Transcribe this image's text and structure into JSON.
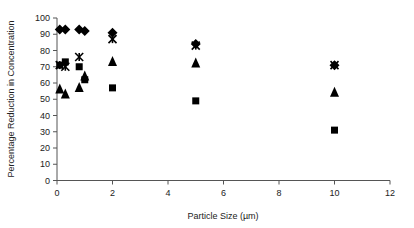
{
  "chart_data": {
    "type": "scatter",
    "title": "",
    "xlabel": "Particle Size (µm)",
    "ylabel": "Percentage Reduction in Concentration",
    "xlim": [
      0,
      12
    ],
    "ylim": [
      0,
      100
    ],
    "xticks": [
      0,
      2,
      4,
      6,
      8,
      10,
      12
    ],
    "yticks": [
      0,
      10,
      20,
      30,
      40,
      50,
      60,
      70,
      80,
      90,
      100
    ],
    "grid": false,
    "legend": "none",
    "series": [
      {
        "name": "diamond",
        "marker": "diamond",
        "x": [
          0.1,
          0.3,
          0.8,
          1.0,
          2,
          5,
          10
        ],
        "y": [
          93,
          93,
          93,
          92,
          91,
          84,
          71
        ]
      },
      {
        "name": "asterisk",
        "marker": "asterisk",
        "x": [
          0.1,
          0.3,
          0.8,
          2,
          5,
          10
        ],
        "y": [
          71,
          70,
          76,
          87,
          83,
          71
        ]
      },
      {
        "name": "square",
        "marker": "square",
        "x": [
          0.1,
          0.3,
          0.8,
          1.0,
          2,
          5,
          10
        ],
        "y": [
          71,
          73,
          70,
          62,
          57,
          49,
          31
        ]
      },
      {
        "name": "triangle",
        "marker": "triangle",
        "x": [
          0.1,
          0.3,
          0.8,
          1.0,
          2,
          5,
          10
        ],
        "y": [
          56,
          53,
          57,
          64,
          73,
          72,
          54
        ]
      }
    ]
  }
}
